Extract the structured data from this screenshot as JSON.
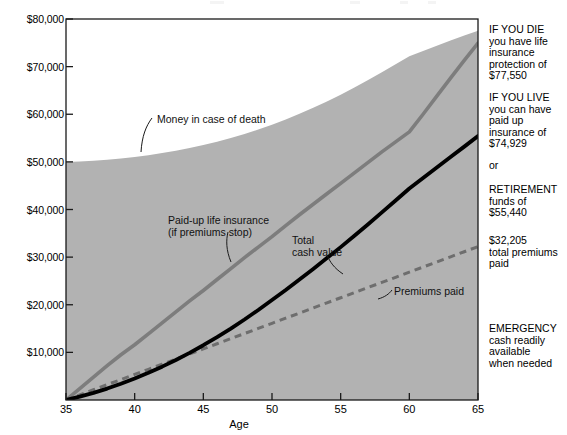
{
  "axes": {
    "y_ticks": [
      "$10,000",
      "$20,000",
      "$30,000",
      "$40,000",
      "$50,000",
      "$60,000",
      "$70,000",
      "$80,000"
    ],
    "x_ticks": [
      "35",
      "40",
      "45",
      "50",
      "55",
      "60",
      "65"
    ],
    "x_title": "Age"
  },
  "plot_labels": {
    "death_benefit": "Money in case of death",
    "paid_up_line1": "Paid-up life insurance",
    "paid_up_line2": "(if premiums stop)",
    "total_cash_line1": "Total",
    "total_cash_line2": "cash value",
    "premiums": "Premiums paid"
  },
  "side_panel": {
    "if_you_die": {
      "heading": "IF YOU DIE",
      "line1": "you have life",
      "line2": "insurance",
      "line3": "protection of",
      "amount": "$77,550"
    },
    "if_you_live": {
      "heading": "IF YOU LIVE",
      "line1": "you can have",
      "line2": "paid up",
      "line3": "insurance of",
      "amount": "$74,929"
    },
    "or": "or",
    "retirement": {
      "heading": "RETIREMENT",
      "line1": "funds of",
      "amount": "$55,440"
    },
    "premiums_total": {
      "amount": "$32,205",
      "line1": "total premiums",
      "line2": "paid"
    },
    "emergency": {
      "heading": "EMERGENCY",
      "line1": "cash readily",
      "line2": "available",
      "line3": "when needed"
    }
  },
  "colors": {
    "area_fill": "#b2b2b2",
    "paid_up_line": "#7d7d7d",
    "total_cash_line": "#000000",
    "premiums_line": "#6e6e6e",
    "axis": "#1a1a1a"
  },
  "chart_data": {
    "type": "area",
    "title": "",
    "subtitle": "",
    "xlabel": "Age",
    "ylabel": "",
    "x": [
      35,
      36,
      37,
      38,
      39,
      40,
      41,
      42,
      43,
      44,
      45,
      46,
      47,
      48,
      49,
      50,
      51,
      52,
      53,
      54,
      55,
      56,
      57,
      58,
      59,
      60,
      61,
      62,
      63,
      64,
      65
    ],
    "xlim": [
      35,
      65
    ],
    "ylim": [
      0,
      80000
    ],
    "y_tick_values": [
      10000,
      20000,
      30000,
      40000,
      50000,
      60000,
      70000,
      80000
    ],
    "x_tick_values": [
      35,
      40,
      45,
      50,
      55,
      60,
      65
    ],
    "grid": false,
    "legend": "none (direct labels)",
    "series": [
      {
        "name": "Money in case of death",
        "style": "filled-area",
        "color": "#b2b2b2",
        "values": [
          50000,
          50100,
          50250,
          50450,
          50700,
          51000,
          51400,
          51850,
          52350,
          52900,
          53550,
          54250,
          55000,
          55850,
          56800,
          57800,
          58900,
          60100,
          61350,
          62700,
          64100,
          65600,
          67200,
          68800,
          70500,
          72200,
          73300,
          74400,
          75500,
          76550,
          77550
        ]
      },
      {
        "name": "Paid-up life insurance (if premiums stop)",
        "style": "solid-line",
        "color": "#7d7d7d",
        "values": [
          0,
          2400,
          4800,
          7200,
          9500,
          11600,
          13900,
          16200,
          18500,
          20800,
          23000,
          25300,
          27600,
          29900,
          32100,
          34300,
          36600,
          38900,
          41100,
          43300,
          45500,
          47700,
          49900,
          52100,
          54200,
          56300,
          60000,
          63800,
          67600,
          71300,
          74929
        ]
      },
      {
        "name": "Total cash value",
        "style": "solid-line-thick",
        "color": "#000000",
        "values": [
          0,
          700,
          1500,
          2400,
          3400,
          4500,
          5700,
          7000,
          8400,
          9900,
          11500,
          13200,
          15000,
          16900,
          18900,
          21000,
          23100,
          25300,
          27500,
          29800,
          32100,
          34500,
          36900,
          39400,
          41900,
          44400,
          46600,
          48800,
          51000,
          53200,
          55440
        ]
      },
      {
        "name": "Premiums paid",
        "style": "dashed-line",
        "color": "#6e6e6e",
        "values": [
          0,
          1074,
          2147,
          3221,
          4294,
          5368,
          6441,
          7515,
          8588,
          9662,
          10735,
          11809,
          12882,
          13956,
          15029,
          16103,
          17176,
          18250,
          19323,
          20397,
          21470,
          22544,
          23617,
          24691,
          25764,
          26838,
          27911,
          28985,
          30058,
          31132,
          32205
        ]
      }
    ],
    "annotations": [
      {
        "text": "Money in case of death",
        "x": 41,
        "y": 61000
      },
      {
        "text": "Paid-up life insurance (if premiums stop)",
        "x": 43,
        "y": 40500
      },
      {
        "text": "Total cash value",
        "x": 52,
        "y": 33000
      },
      {
        "text": "Premiums paid",
        "x": 57,
        "y": 21500
      }
    ],
    "endpoint_callouts": {
      "death_benefit_at_65": 77550,
      "paid_up_at_65": 74929,
      "total_cash_at_65": 55440,
      "premiums_at_65": 32205
    }
  }
}
